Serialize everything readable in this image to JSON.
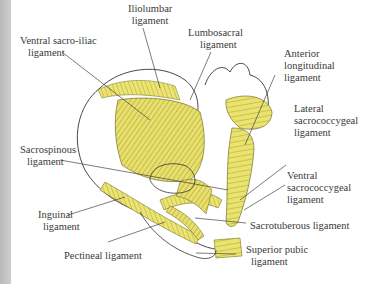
{
  "colors": {
    "ligament": "#e8e06a",
    "ligament_dark": "#6d6a1e",
    "outline": "#333333",
    "strip": "#c4c4c4"
  },
  "labels": {
    "iliolumbar": {
      "line1": "Iliolumbar",
      "line2": "ligament"
    },
    "ventral_sacroiliac": {
      "line1": "Ventral sacro-iliac",
      "line2": "ligament"
    },
    "lumbosacral": {
      "line1": "Lumbosacral",
      "line2": "ligament"
    },
    "anterior_longitudinal": {
      "line1": "Anterior",
      "line2": "longitudinal",
      "line3": "ligament"
    },
    "lateral_sacrococcygeal": {
      "line1": "Lateral",
      "line2": "sacrococcygeal",
      "line3": "ligament"
    },
    "sacrospinous": {
      "line1": "Sacrospinous",
      "line2": "ligament"
    },
    "ventral_sacrococcygeal": {
      "line1": "Ventral",
      "line2": "sacrococcygeal",
      "line3": "ligament"
    },
    "inguinal": {
      "line1": "Inguinal",
      "line2": "ligament"
    },
    "sacrotuberous": {
      "line1": "Sacrotuberous ligament"
    },
    "pectineal": {
      "line1": "Pectineal ligament"
    },
    "superior_pubic": {
      "line1": "Superior pubic",
      "line2": "ligament"
    }
  }
}
